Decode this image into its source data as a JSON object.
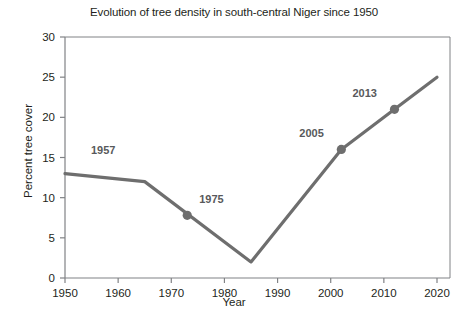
{
  "chart_data": {
    "type": "line",
    "title": "Evolution of tree density in south-central Niger since 1950",
    "xlabel": "Year",
    "ylabel": "Percent tree cover",
    "xlim": [
      1950,
      2020
    ],
    "ylim": [
      0,
      30
    ],
    "xticks": [
      1950,
      1960,
      1970,
      1980,
      1990,
      2000,
      2010,
      2020
    ],
    "yticks": [
      0,
      5,
      10,
      15,
      20,
      25,
      30
    ],
    "grid": false,
    "legend": false,
    "line_color": "#6e6e6e",
    "series": [
      {
        "name": "Percent tree cover",
        "x": [
          1950,
          1965,
          1985,
          2002,
          2012,
          2020
        ],
        "values": [
          13,
          12,
          2,
          16,
          21,
          25
        ]
      }
    ],
    "markers": [
      {
        "label": "1957",
        "x": 1950,
        "y": 13,
        "marker_visible": false,
        "label_dx": 26,
        "label_dy": -20
      },
      {
        "label": "1975",
        "x": 1973,
        "y": 7.8,
        "marker_visible": true,
        "label_dx": 12,
        "label_dy": -12
      },
      {
        "label": "2005",
        "x": 2002,
        "y": 16,
        "marker_visible": true,
        "label_dx": -42,
        "label_dy": -12
      },
      {
        "label": "2013",
        "x": 2012,
        "y": 21,
        "marker_visible": true,
        "label_dx": -42,
        "label_dy": -12
      }
    ]
  }
}
